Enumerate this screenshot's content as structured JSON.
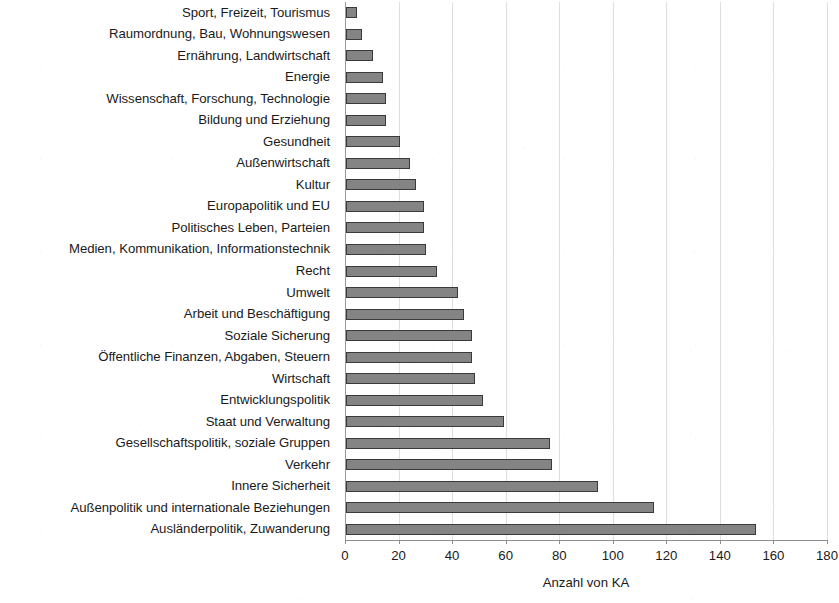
{
  "chart_data": {
    "type": "bar",
    "orientation": "horizontal",
    "title": "",
    "xlabel": "Anzahl von KA",
    "ylabel": "",
    "xlim": [
      0,
      180
    ],
    "xticks": [
      0,
      20,
      40,
      60,
      80,
      100,
      120,
      140,
      160,
      180
    ],
    "grid": true,
    "legend": false,
    "bar_color": "#848484",
    "bar_border_color": "#3a3a3a",
    "gridline_color": "#dedede",
    "axis_color": "#8e8e8e",
    "text_color": "#1a1a1a",
    "categories": [
      "Sport, Freizeit, Tourismus",
      "Raumordnung, Bau, Wohnungswesen",
      "Ernährung, Landwirtschaft",
      "Energie",
      "Wissenschaft, Forschung, Technologie",
      "Bildung und Erziehung",
      "Gesundheit",
      "Außenwirtschaft",
      "Kultur",
      "Europapolitik und EU",
      "Politisches Leben, Parteien",
      "Medien, Kommunikation, Informationstechnik",
      "Recht",
      "Umwelt",
      "Arbeit und Beschäftigung",
      "Soziale Sicherung",
      "Öffentliche Finanzen, Abgaben, Steuern",
      "Wirtschaft",
      "Entwicklungspolitik",
      "Staat und Verwaltung",
      "Gesellschaftspolitik, soziale Gruppen",
      "Verkehr",
      "Innere Sicherheit",
      "Außenpolitik und internationale Beziehungen",
      "Ausländerpolitik, Zuwanderung"
    ],
    "values": [
      4,
      6,
      10,
      14,
      15,
      15,
      20,
      24,
      26,
      29,
      29,
      30,
      34,
      42,
      44,
      47,
      47,
      48,
      51,
      59,
      76,
      77,
      94,
      115,
      153
    ]
  }
}
